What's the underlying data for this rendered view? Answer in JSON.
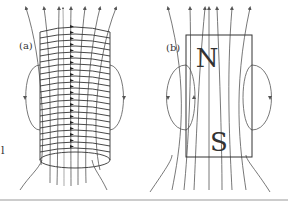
{
  "figure": {
    "panel_a": {
      "label": "(a)",
      "description": "solenoid with field lines",
      "coil_turns": 20,
      "side_mark": "l"
    },
    "panel_b": {
      "label": "(b)",
      "description": "bar magnet with field lines",
      "north_label": "N",
      "south_label": "S"
    }
  },
  "colors": {
    "line": "#444444",
    "field": "#666666",
    "rule": "#999999"
  }
}
